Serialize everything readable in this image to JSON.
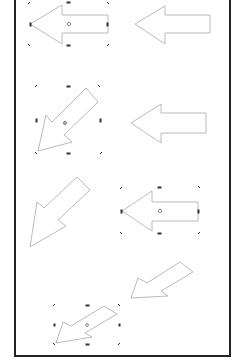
{
  "figure": {
    "colors": {
      "arrow_stroke": "#a8a8a8",
      "handle": "#333333",
      "frame": "#222222",
      "background": "#ffffff"
    },
    "panels": [
      {
        "id": "row1-left",
        "shape": "left-arrow",
        "selected": true,
        "rotation": 0
      },
      {
        "id": "row1-right",
        "shape": "left-arrow",
        "selected": false,
        "rotation": 0
      },
      {
        "id": "row2-left",
        "shape": "left-arrow",
        "selected": true,
        "rotation": -45
      },
      {
        "id": "row2-right",
        "shape": "left-arrow",
        "selected": false,
        "rotation": 0
      },
      {
        "id": "row3-left",
        "shape": "left-arrow",
        "selected": false,
        "rotation": -45
      },
      {
        "id": "row3-right",
        "shape": "left-arrow",
        "selected": true,
        "rotation": 0
      },
      {
        "id": "row4-right",
        "shape": "left-arrow",
        "selected": false,
        "rotation": -30
      },
      {
        "id": "row4-left",
        "shape": "left-arrow",
        "selected": true,
        "rotation": -30
      }
    ]
  }
}
